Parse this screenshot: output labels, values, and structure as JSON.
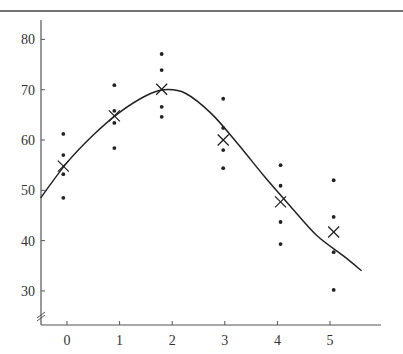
{
  "chart_data": {
    "type": "scatter",
    "title": "",
    "xlabel": "",
    "ylabel": "",
    "xlim": [
      -0.5,
      5.95
    ],
    "ylim": [
      23,
      84
    ],
    "x_ticks": [
      0,
      1,
      2,
      3,
      4,
      5
    ],
    "y_ticks": [
      30,
      40,
      50,
      60,
      70,
      80
    ],
    "y_axis_break": true,
    "grid": false,
    "legend": null,
    "series": [
      {
        "name": "observations",
        "marker": "dot",
        "points": [
          {
            "x": -0.07,
            "y": 61.2
          },
          {
            "x": -0.07,
            "y": 57.0
          },
          {
            "x": -0.07,
            "y": 53.2
          },
          {
            "x": -0.07,
            "y": 48.5
          },
          {
            "x": 0.9,
            "y": 70.9
          },
          {
            "x": 0.9,
            "y": 65.8
          },
          {
            "x": 0.9,
            "y": 63.4
          },
          {
            "x": 0.9,
            "y": 58.4
          },
          {
            "x": 1.8,
            "y": 77.1
          },
          {
            "x": 1.8,
            "y": 73.9
          },
          {
            "x": 1.8,
            "y": 66.6
          },
          {
            "x": 1.8,
            "y": 64.6
          },
          {
            "x": 2.97,
            "y": 68.2
          },
          {
            "x": 2.97,
            "y": 62.4
          },
          {
            "x": 2.97,
            "y": 58.0
          },
          {
            "x": 2.97,
            "y": 54.4
          },
          {
            "x": 4.06,
            "y": 55.0
          },
          {
            "x": 4.06,
            "y": 50.9
          },
          {
            "x": 4.06,
            "y": 43.7
          },
          {
            "x": 4.06,
            "y": 39.3
          },
          {
            "x": 5.07,
            "y": 52.0
          },
          {
            "x": 5.07,
            "y": 44.7
          },
          {
            "x": 5.07,
            "y": 37.7
          },
          {
            "x": 5.07,
            "y": 30.2
          }
        ]
      },
      {
        "name": "group means",
        "marker": "x",
        "points": [
          {
            "x": -0.07,
            "y": 54.8
          },
          {
            "x": 0.9,
            "y": 64.8
          },
          {
            "x": 1.8,
            "y": 70.1
          },
          {
            "x": 2.97,
            "y": 60.0
          },
          {
            "x": 4.06,
            "y": 47.7
          },
          {
            "x": 5.07,
            "y": 41.7
          }
        ]
      },
      {
        "name": "fitted curve",
        "marker": "line",
        "points": [
          {
            "x": -0.5,
            "y": 48.5
          },
          {
            "x": 0.0,
            "y": 55.5
          },
          {
            "x": 0.5,
            "y": 61.0
          },
          {
            "x": 1.0,
            "y": 65.5
          },
          {
            "x": 1.5,
            "y": 68.8
          },
          {
            "x": 1.85,
            "y": 70.0
          },
          {
            "x": 2.25,
            "y": 69.3
          },
          {
            "x": 2.75,
            "y": 65.2
          },
          {
            "x": 3.25,
            "y": 59.2
          },
          {
            "x": 3.75,
            "y": 52.8
          },
          {
            "x": 4.25,
            "y": 46.8
          },
          {
            "x": 4.75,
            "y": 41.0
          },
          {
            "x": 5.25,
            "y": 37.0
          },
          {
            "x": 5.6,
            "y": 34.0
          }
        ]
      }
    ]
  },
  "axes": {
    "y_tick_labels": [
      "30",
      "40",
      "50",
      "60",
      "70",
      "80"
    ],
    "x_tick_labels": [
      "0",
      "1",
      "2",
      "3",
      "4",
      "5"
    ]
  },
  "colors": {
    "ink": "#222222",
    "axis": "#555555",
    "border": "#444444"
  }
}
